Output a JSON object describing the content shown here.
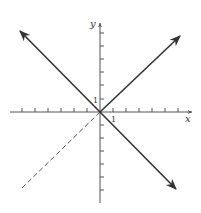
{
  "diagram": {
    "type": "coordinate-plane",
    "axes": {
      "x_label": "x",
      "y_label": "y",
      "x_tick_label": "1",
      "y_tick_label": "1",
      "x_ticks_each_side": 7,
      "y_ticks_each_side": 7
    },
    "lines": [
      {
        "name": "y = x (x >= 0, solid)",
        "style": "solid",
        "arrow": "end"
      },
      {
        "name": "y = x (x < 0, dashed)",
        "style": "dashed",
        "arrow": "none"
      },
      {
        "name": "y = -x",
        "style": "solid",
        "arrow": "both"
      }
    ],
    "colors": {
      "line": "#333333",
      "axis": "#555555",
      "background": "#ffffff"
    }
  }
}
